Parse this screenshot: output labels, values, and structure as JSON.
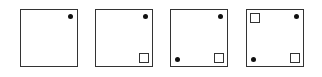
{
  "diagram": {
    "type": "sequence-of-squares",
    "panel_count": 4,
    "colors": {
      "border": "#333333",
      "dot": "#111111",
      "background": "#ffffff"
    },
    "panels": [
      {
        "index": 1,
        "elements": [
          {
            "shape": "dot",
            "position": "top-right"
          }
        ]
      },
      {
        "index": 2,
        "elements": [
          {
            "shape": "dot",
            "position": "top-right"
          },
          {
            "shape": "small-square",
            "position": "bottom-right"
          }
        ]
      },
      {
        "index": 3,
        "elements": [
          {
            "shape": "dot",
            "position": "top-right"
          },
          {
            "shape": "small-square",
            "position": "bottom-right"
          },
          {
            "shape": "dot",
            "position": "bottom-left"
          }
        ]
      },
      {
        "index": 4,
        "elements": [
          {
            "shape": "dot",
            "position": "top-right"
          },
          {
            "shape": "small-square",
            "position": "bottom-right"
          },
          {
            "shape": "dot",
            "position": "bottom-left"
          },
          {
            "shape": "small-square",
            "position": "top-left"
          }
        ]
      }
    ]
  }
}
